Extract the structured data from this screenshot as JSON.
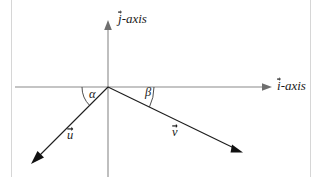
{
  "figure": {
    "kind": "vector-angle-diagram",
    "background_color": "#ffffff",
    "axis_color": "#8a8a8a",
    "vector_color": "#1d1d1d",
    "frame_color": "#d6d6d6",
    "labels": {
      "j_axis": {
        "symbol": "j",
        "suffix": "-axis",
        "vector_accent": true
      },
      "i_axis": {
        "symbol": "i",
        "suffix": "-axis",
        "vector_accent": true
      },
      "alpha": "α",
      "beta": "β",
      "u_vector": {
        "symbol": "u",
        "vector_accent": true
      },
      "v_vector": {
        "symbol": "v",
        "vector_accent": true
      }
    },
    "geometry": {
      "origin": {
        "x": 108,
        "y": 87
      },
      "i_axis": {
        "x_start": 15,
        "x_end": 272,
        "y": 87
      },
      "j_axis": {
        "x": 108,
        "y_top": 20,
        "y_bottom": 177
      },
      "u_vector": {
        "from_x": 108,
        "from_y": 87,
        "to_x": 32,
        "to_y": 163
      },
      "v_vector": {
        "from_x": 108,
        "from_y": 87,
        "to_x": 243,
        "to_y": 152
      },
      "alpha_arc_radius": 26,
      "beta_arc_radius": 46
    }
  }
}
